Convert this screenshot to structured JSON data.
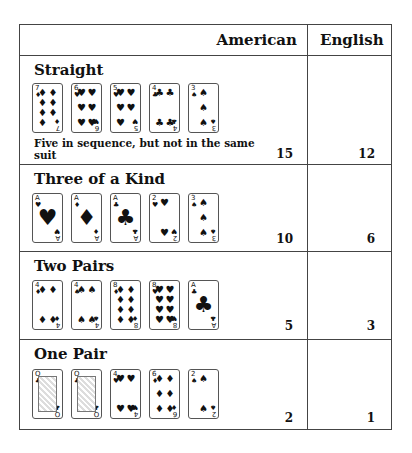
{
  "header": {
    "american": "American",
    "english": "English"
  },
  "rows": [
    {
      "title": "Straight",
      "description": "Five in sequence, but not in the same suit",
      "american": "15",
      "english": "12",
      "cards": [
        {
          "rank": "7",
          "suit": "♦",
          "count": 7
        },
        {
          "rank": "6",
          "suit": "♥",
          "count": 6
        },
        {
          "rank": "5",
          "suit": "♥",
          "count": 5
        },
        {
          "rank": "4",
          "suit": "♣",
          "count": 4
        },
        {
          "rank": "3",
          "suit": "♠",
          "count": 3
        }
      ]
    },
    {
      "title": "Three of a Kind",
      "american": "10",
      "english": "6",
      "cards": [
        {
          "rank": "A",
          "suit": "♥"
        },
        {
          "rank": "A",
          "suit": "♦"
        },
        {
          "rank": "A",
          "suit": "♣"
        },
        {
          "rank": "2",
          "suit": "♥"
        },
        {
          "rank": "3",
          "suit": "♠"
        }
      ]
    },
    {
      "title": "Two Pairs",
      "american": "5",
      "english": "3",
      "cards": [
        {
          "rank": "4",
          "suit": "♦"
        },
        {
          "rank": "4",
          "suit": "♠"
        },
        {
          "rank": "8",
          "suit": "♦"
        },
        {
          "rank": "8",
          "suit": "♥"
        },
        {
          "rank": "A",
          "suit": "♣"
        }
      ]
    },
    {
      "title": "One Pair",
      "american": "2",
      "english": "1",
      "cards": [
        {
          "rank": "Q",
          "suit": "♣"
        },
        {
          "rank": "Q",
          "suit": "♣"
        },
        {
          "rank": "4",
          "suit": "♥"
        },
        {
          "rank": "6",
          "suit": "♦"
        },
        {
          "rank": "2",
          "suit": "♠"
        }
      ]
    }
  ]
}
